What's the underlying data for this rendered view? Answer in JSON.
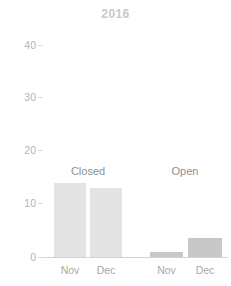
{
  "chart_data": {
    "type": "bar",
    "title": "2016",
    "xlabel": "",
    "ylabel": "",
    "ylim": [
      0,
      44
    ],
    "yticks": [
      0,
      10,
      20,
      30,
      40
    ],
    "ytick_labels": [
      "0",
      "10",
      "20",
      "30",
      "40"
    ],
    "grid": false,
    "legend": "none",
    "group_labels": [
      "Closed",
      "Open"
    ],
    "categories": [
      "Nov",
      "Dec",
      "Nov",
      "Dec"
    ],
    "groups": [
      {
        "name": "Closed",
        "color": "#e4e4e4",
        "bars": [
          {
            "label": "Nov",
            "value": 14
          },
          {
            "label": "Dec",
            "value": 13
          }
        ]
      },
      {
        "name": "Open",
        "color": "#c8c8c8",
        "bars": [
          {
            "label": "Nov",
            "value": 1
          },
          {
            "label": "Dec",
            "value": 3.6
          }
        ]
      }
    ],
    "values": [
      14,
      13,
      1,
      3.6
    ],
    "colors": {
      "closed_bar": "#e4e4e4",
      "open_bar": "#c8c8c8",
      "title_text": "#c9c9c9",
      "tick_text": "#b4b4b4",
      "group_label_text": "#8f8f8f",
      "axis_line": "#d2d2d2",
      "background": "#ffffff"
    }
  }
}
